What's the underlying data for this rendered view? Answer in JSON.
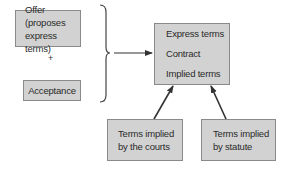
{
  "diagram": {
    "offer": {
      "lines": [
        "Offer (proposes",
        "express terms)"
      ]
    },
    "plus": "+",
    "acceptance": {
      "label": "Acceptance"
    },
    "contract": {
      "lines": [
        "Express terms",
        "Contract",
        "Implied terms"
      ]
    },
    "courts": {
      "lines": [
        "Terms implied",
        "by the courts"
      ]
    },
    "statute": {
      "lines": [
        "Terms implied",
        "by statute"
      ]
    },
    "colors": {
      "box_fill": "#d2d2d2",
      "box_border": "#8a8a8a",
      "arrow": "#333333",
      "text": "#2a2a2a"
    },
    "connections": [
      {
        "from": "offer+acceptance",
        "to": "contract",
        "type": "brace-arrow"
      },
      {
        "from": "courts",
        "to": "contract",
        "type": "arrow"
      },
      {
        "from": "statute",
        "to": "contract",
        "type": "arrow"
      }
    ]
  }
}
